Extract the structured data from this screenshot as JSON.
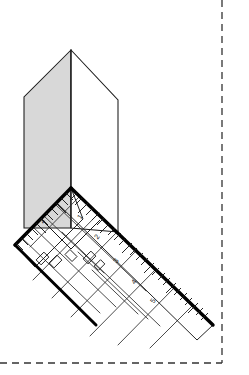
{
  "figure": {
    "canvas": {
      "width": 249,
      "height": 375,
      "background": "#ffffff"
    }
  },
  "colors": {
    "background": "#ffffff",
    "outline": "#1a1a1a",
    "heavy_outline": "#000000",
    "shaded_face": "#d8d8d8",
    "unshaded_face": "#ffffff",
    "hairline": "#2b2b2b",
    "dashed_border": "#333333"
  },
  "crop_border": {
    "name": "dashed-page-border",
    "style": "dashed",
    "dash_pattern": "7 5",
    "stroke_width": 1.3,
    "right_edge_x": 222,
    "bottom_edge_y": 363,
    "corner_x": 222,
    "corner_y": 363
  },
  "prism": {
    "name": "vertical-triangular-prism",
    "apex": {
      "x": 71,
      "y": 50
    },
    "left_shoulder": {
      "x": 24,
      "y": 97
    },
    "right_shoulder": {
      "x": 118,
      "y": 100
    },
    "base_center": {
      "x": 71,
      "y": 228
    },
    "left_base": {
      "x": 24,
      "y": 228
    },
    "right_base": {
      "x": 118,
      "y": 232
    },
    "left_face_fill": "#d8d8d8",
    "right_face_fill": "#ffffff",
    "ridge_line": {
      "from_x": 71,
      "from_y": 50,
      "to_x": 71,
      "to_y": 228
    }
  },
  "ruler": {
    "name": "l-shaped-measuring-square",
    "corner": {
      "x": 71,
      "y": 188
    },
    "left_arm_end": {
      "x": 15,
      "y": 245
    },
    "right_arm_end": {
      "x": 213,
      "y": 325
    },
    "body_depth": 22,
    "edge_stroke_width": 3.4,
    "left_arm_angle_deg": 134,
    "right_arm_angle_deg": 35.7
  },
  "graduations": {
    "left_arm": {
      "name": "left-arm-scale",
      "minor_tick_count": 11,
      "minor_tick_length": 7,
      "major_tick_length": 11,
      "labels": [
        {
          "value": "2",
          "x": 44,
          "y": 222,
          "rotation": -55
        }
      ]
    },
    "right_arm": {
      "name": "right-arm-scale",
      "minor_tick_count": 26,
      "minor_tick_length": 7,
      "major_tick_length": 11,
      "labels": [
        {
          "value": "1",
          "x": 82,
          "y": 218,
          "rotation": -55
        },
        {
          "value": "2",
          "x": 99,
          "y": 238,
          "rotation": -55
        },
        {
          "value": "3",
          "x": 118,
          "y": 262,
          "rotation": -55
        },
        {
          "value": "4",
          "x": 136,
          "y": 283,
          "rotation": -55
        },
        {
          "value": "5",
          "x": 155,
          "y": 302,
          "rotation": -55
        }
      ]
    }
  },
  "lattice": {
    "name": "diagonal-grid-pattern",
    "description": "Crossing diagonal hairlines forming a diamond lattice across the ruler face and extending below it",
    "stroke_width": 0.85,
    "direction_a_count": 7,
    "direction_b_count": 7
  },
  "inner_detail": {
    "name": "inner-rectangle-cutouts",
    "count": 5,
    "description": "Small rectangular outlines set within the lattice near the ruler corner"
  }
}
